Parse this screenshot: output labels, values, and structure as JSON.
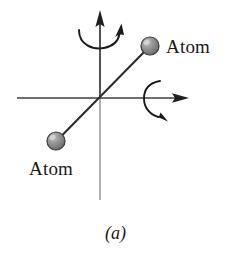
{
  "figure": {
    "caption": "(a)",
    "background_color": "#ffffff",
    "labels": {
      "atom_top_right": "Atom",
      "atom_bottom_left": "Atom"
    },
    "colors": {
      "axis_dark": "#3a3a3a",
      "axis_light": "#9a9a9a",
      "bond_line": "#2e2e2e",
      "atom_fill": "#8c8c8c",
      "atom_fill_dark": "#6d6d6d",
      "atom_outline": "#333333",
      "atom_highlight": "#c9c9c9",
      "rotation_arrow": "#1a1a1a",
      "text": "#1a1a1a"
    },
    "axes": {
      "y_axis": {
        "name": "vertical-rotation-axis",
        "x": 100,
        "top_tip_y": 11,
        "bottom_y": 200,
        "arrowhead": "up"
      },
      "x_axis": {
        "name": "horizontal-rotation-axis",
        "y": 98,
        "left_x": 17,
        "right_tip_x": 188,
        "arrowhead": "right"
      }
    },
    "molecule": {
      "bond": {
        "x1": 57,
        "y1": 141,
        "x2": 149,
        "y2": 47
      },
      "atoms": [
        {
          "name": "atom-top-right",
          "cx": 150,
          "cy": 46,
          "r": 9
        },
        {
          "name": "atom-bottom-left",
          "cx": 56,
          "cy": 141,
          "r": 9
        }
      ]
    },
    "rotation_arrows": [
      {
        "name": "rotation-arrow-y-axis",
        "about": "y-axis",
        "position": "top",
        "direction": "counterclockwise-about-vertical"
      },
      {
        "name": "rotation-arrow-x-axis",
        "about": "x-axis",
        "position": "right",
        "direction": "clockwise-about-horizontal"
      }
    ]
  }
}
